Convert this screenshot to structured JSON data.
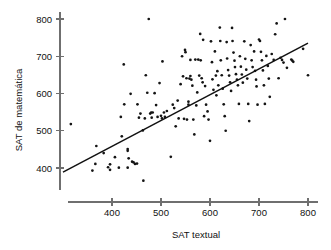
{
  "chart_data": {
    "type": "scatter",
    "title": "",
    "xlabel": "SAT textual",
    "ylabel": "SAT de matemática",
    "xlim": [
      300,
      810
    ],
    "ylim": [
      350,
      815
    ],
    "grid": false,
    "legend": null,
    "x_ticks": [
      400,
      500,
      600,
      700,
      800
    ],
    "y_ticks": [
      400,
      500,
      600,
      700,
      800
    ],
    "x_tick_labels": [
      "400",
      "500",
      "600",
      "700",
      "800"
    ],
    "y_tick_labels": [
      "400",
      "500",
      "600",
      "700",
      "800"
    ],
    "marker": "dot",
    "marker_color": "#141414",
    "trendline": {
      "label": "linha de regressão",
      "color": "#111111",
      "x_start": 300,
      "y_start": 389,
      "x_end": 800,
      "y_end": 735
    },
    "points": [
      [
        316,
        518
      ],
      [
        360,
        393
      ],
      [
        366,
        411
      ],
      [
        368,
        459
      ],
      [
        383,
        440
      ],
      [
        392,
        402
      ],
      [
        396,
        410
      ],
      [
        396,
        395
      ],
      [
        406,
        429
      ],
      [
        414,
        401
      ],
      [
        418,
        537
      ],
      [
        420,
        485
      ],
      [
        424,
        678
      ],
      [
        425,
        571
      ],
      [
        432,
        451
      ],
      [
        432,
        446
      ],
      [
        432,
        401
      ],
      [
        434,
        426
      ],
      [
        438,
        599
      ],
      [
        441,
        417
      ],
      [
        444,
        415
      ],
      [
        447,
        411
      ],
      [
        451,
        412
      ],
      [
        452,
        571
      ],
      [
        455,
        535
      ],
      [
        458,
        546
      ],
      [
        463,
        501
      ],
      [
        464,
        366
      ],
      [
        467,
        533
      ],
      [
        469,
        649
      ],
      [
        472,
        602
      ],
      [
        475,
        800
      ],
      [
        478,
        546
      ],
      [
        480,
        549
      ],
      [
        481,
        535
      ],
      [
        483,
        549
      ],
      [
        487,
        601
      ],
      [
        490,
        569
      ],
      [
        493,
        537
      ],
      [
        497,
        628
      ],
      [
        500,
        540
      ],
      [
        502,
        533
      ],
      [
        503,
        686
      ],
      [
        506,
        549
      ],
      [
        508,
        537
      ],
      [
        512,
        553
      ],
      [
        520,
        430
      ],
      [
        524,
        570
      ],
      [
        527,
        561
      ],
      [
        530,
        512
      ],
      [
        534,
        581
      ],
      [
        536,
        533
      ],
      [
        540,
        625
      ],
      [
        543,
        700
      ],
      [
        545,
        646
      ],
      [
        547,
        532
      ],
      [
        549,
        717
      ],
      [
        550,
        711
      ],
      [
        552,
        641
      ],
      [
        553,
        530
      ],
      [
        556,
        578
      ],
      [
        556,
        570
      ],
      [
        558,
        640
      ],
      [
        560,
        690
      ],
      [
        560,
        647
      ],
      [
        562,
        637
      ],
      [
        564,
        621
      ],
      [
        566,
        530
      ],
      [
        568,
        490
      ],
      [
        570,
        691
      ],
      [
        572,
        568
      ],
      [
        574,
        603
      ],
      [
        576,
        691
      ],
      [
        578,
        648
      ],
      [
        580,
        760
      ],
      [
        581,
        689
      ],
      [
        583,
        641
      ],
      [
        585,
        630
      ],
      [
        586,
        744
      ],
      [
        588,
        539
      ],
      [
        590,
        620
      ],
      [
        592,
        570
      ],
      [
        595,
        552
      ],
      [
        597,
        530
      ],
      [
        600,
        473
      ],
      [
        602,
        740
      ],
      [
        604,
        684
      ],
      [
        605,
        638
      ],
      [
        607,
        610
      ],
      [
        610,
        713
      ],
      [
        612,
        648
      ],
      [
        613,
        595
      ],
      [
        615,
        660
      ],
      [
        617,
        622
      ],
      [
        620,
        777
      ],
      [
        621,
        741
      ],
      [
        622,
        689
      ],
      [
        624,
        649
      ],
      [
        626,
        613
      ],
      [
        628,
        571
      ],
      [
        630,
        539
      ],
      [
        632,
        500
      ],
      [
        634,
        738
      ],
      [
        635,
        694
      ],
      [
        637,
        663
      ],
      [
        639,
        648
      ],
      [
        641,
        630
      ],
      [
        643,
        607
      ],
      [
        645,
        776
      ],
      [
        646,
        741
      ],
      [
        648,
        710
      ],
      [
        650,
        688
      ],
      [
        651,
        671
      ],
      [
        653,
        652
      ],
      [
        655,
        637
      ],
      [
        657,
        622
      ],
      [
        659,
        572
      ],
      [
        661,
        700
      ],
      [
        663,
        672
      ],
      [
        665,
        651
      ],
      [
        667,
        629
      ],
      [
        670,
        740
      ],
      [
        672,
        693
      ],
      [
        674,
        664
      ],
      [
        676,
        640
      ],
      [
        678,
        572
      ],
      [
        680,
        526
      ],
      [
        683,
        730
      ],
      [
        685,
        689
      ],
      [
        687,
        671
      ],
      [
        690,
        713
      ],
      [
        692,
        661
      ],
      [
        694,
        637
      ],
      [
        695,
        619
      ],
      [
        697,
        570
      ],
      [
        700,
        745
      ],
      [
        702,
        741
      ],
      [
        704,
        712
      ],
      [
        706,
        689
      ],
      [
        708,
        662
      ],
      [
        710,
        622
      ],
      [
        712,
        572
      ],
      [
        715,
        701
      ],
      [
        718,
        674
      ],
      [
        720,
        640
      ],
      [
        722,
        591
      ],
      [
        726,
        706
      ],
      [
        730,
        690
      ],
      [
        733,
        759
      ],
      [
        736,
        788
      ],
      [
        740,
        641
      ],
      [
        744,
        696
      ],
      [
        747,
        690
      ],
      [
        750,
        683
      ],
      [
        753,
        800
      ],
      [
        757,
        669
      ],
      [
        766,
        691
      ],
      [
        768,
        688
      ],
      [
        770,
        685
      ],
      [
        790,
        720
      ],
      [
        800,
        649
      ]
    ]
  }
}
